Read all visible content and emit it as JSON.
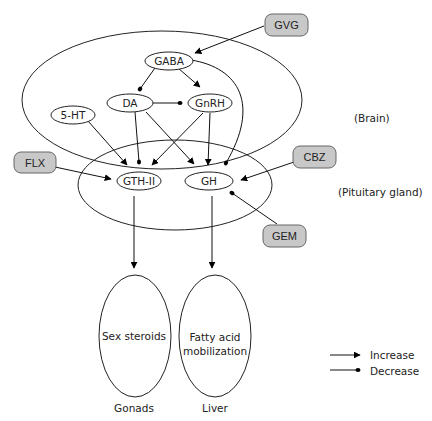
{
  "diagram": {
    "regions": {
      "brain": "(Brain)",
      "pituitary": "(Pituitary gland)"
    },
    "nodes": {
      "gaba": "GABA",
      "da": "DA",
      "gnrh": "GnRH",
      "ht5": "5-HT",
      "gth": "GTH-II",
      "gh": "GH"
    },
    "drugs": {
      "gvg": "GVG",
      "flx": "FLX",
      "cbz": "CBZ",
      "gem": "GEM"
    },
    "targets": {
      "sex_steroids": "Sex steroids",
      "fatty_line1": "Fatty acid",
      "fatty_line2": "mobilization",
      "gonads": "Gonads",
      "liver": "Liver"
    },
    "legend": {
      "increase": "Increase",
      "decrease": "Decrease"
    },
    "edges": [
      {
        "from": "GVG",
        "to": "GABA",
        "type": "increase"
      },
      {
        "from": "GVG",
        "to": "GH",
        "type": "decrease"
      },
      {
        "from": "GABA",
        "to": "DA",
        "type": "decrease"
      },
      {
        "from": "GABA",
        "to": "GnRH",
        "type": "increase"
      },
      {
        "from": "GABA",
        "to": "GH",
        "type": "decrease"
      },
      {
        "from": "DA",
        "to": "GnRH",
        "type": "decrease"
      },
      {
        "from": "DA",
        "to": "GTH-II",
        "type": "decrease"
      },
      {
        "from": "DA",
        "to": "GH",
        "type": "increase"
      },
      {
        "from": "GnRH",
        "to": "GTH-II",
        "type": "increase"
      },
      {
        "from": "GnRH",
        "to": "GH",
        "type": "increase"
      },
      {
        "from": "5-HT",
        "to": "GTH-II",
        "type": "increase"
      },
      {
        "from": "FLX",
        "to": "GTH-II",
        "type": "increase"
      },
      {
        "from": "CBZ",
        "to": "GH",
        "type": "increase"
      },
      {
        "from": "GEM",
        "to": "GH",
        "type": "decrease"
      },
      {
        "from": "GTH-II",
        "to": "Sex steroids",
        "type": "increase"
      },
      {
        "from": "GH",
        "to": "Fatty acid mobilization",
        "type": "increase"
      }
    ]
  }
}
